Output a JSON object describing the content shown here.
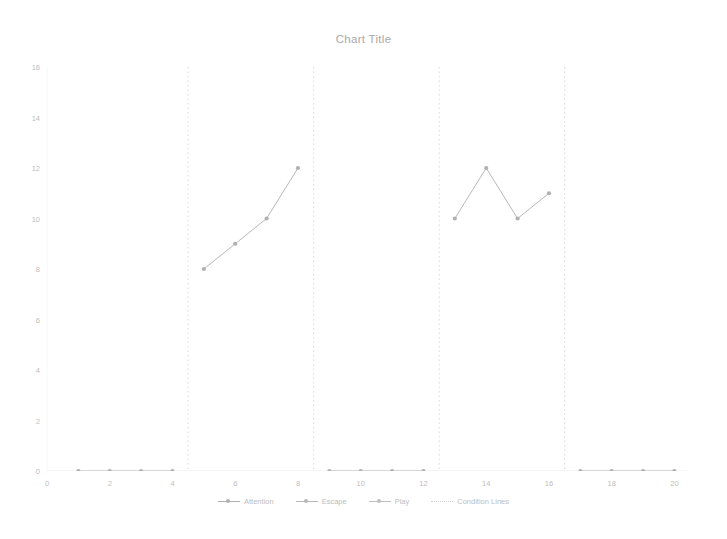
{
  "chart_data": {
    "type": "line",
    "title": "Chart Title",
    "xlabel": "",
    "ylabel": "",
    "xlim": [
      0,
      20.4
    ],
    "ylim": [
      0,
      16
    ],
    "xticks": [
      0,
      2,
      4,
      6,
      8,
      10,
      12,
      14,
      16,
      18,
      20
    ],
    "yticks": [
      0,
      2,
      4,
      6,
      8,
      10,
      12,
      14,
      16
    ],
    "grid": false,
    "legend_position": "bottom",
    "legend": [
      "Attention",
      "Escape",
      "Play",
      "Condition Lines"
    ],
    "series": [
      {
        "name": "Attention",
        "color": "#b0b0b0",
        "segments": [
          {
            "x": [
              1,
              2,
              3,
              4
            ],
            "y": [
              0,
              0,
              0,
              0
            ]
          },
          {
            "x": [
              5,
              6,
              7,
              8
            ],
            "y": [
              8,
              9,
              10,
              12
            ]
          },
          {
            "x": [
              9,
              10,
              11,
              12
            ],
            "y": [
              0,
              0,
              0,
              0
            ]
          },
          {
            "x": [
              13,
              14,
              15,
              16
            ],
            "y": [
              10,
              12,
              10,
              11
            ]
          },
          {
            "x": [
              17,
              18,
              19,
              20
            ],
            "y": [
              0,
              0,
              0,
              0
            ]
          }
        ]
      },
      {
        "name": "Escape",
        "color": "#b8b8b8",
        "segments": []
      },
      {
        "name": "Play",
        "color": "#bfbfbf",
        "segments": []
      }
    ],
    "condition_lines": {
      "name": "Condition Lines",
      "color": "#cfcfcf",
      "style": "dotted",
      "x": [
        4.5,
        8.5,
        12.5,
        16.5
      ]
    }
  },
  "axes": {
    "x_tick_labels": [
      "0",
      "2",
      "4",
      "6",
      "8",
      "10",
      "12",
      "14",
      "16",
      "18",
      "20"
    ],
    "y_tick_labels": [
      "0",
      "2",
      "4",
      "6",
      "8",
      "10",
      "12",
      "14",
      "16"
    ]
  },
  "legend_items": [
    {
      "label": "Attention",
      "marker": "line-marker",
      "color": "#b0b0b0"
    },
    {
      "label": "Escape",
      "marker": "line-marker",
      "color": "#b8b8b8"
    },
    {
      "label": "Play",
      "marker": "line-marker",
      "color": "#bfbfbf"
    },
    {
      "label": "Condition Lines",
      "marker": "dotted-line",
      "color": "#cfcfcf"
    }
  ]
}
